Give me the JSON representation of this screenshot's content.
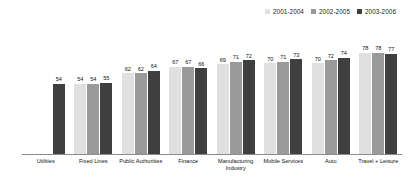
{
  "chart_data": {
    "type": "bar",
    "title": "",
    "subtitle": "",
    "xlabel": "",
    "ylabel": "",
    "ylim": [
      0,
      100
    ],
    "grid": false,
    "legend_position": "top-right",
    "categories": [
      "Utilities",
      "Fixed Lines",
      "Public Authorities",
      "Finance",
      "Manufacturing\nIndustry",
      "Mobile Services",
      "Auto",
      "Travel + Leisure"
    ],
    "series": [
      {
        "name": "2001-2004",
        "color": "#e0e0e0",
        "values": [
          null,
          54,
          62,
          67,
          69,
          70,
          70,
          78
        ]
      },
      {
        "name": "2002-2005",
        "color": "#9a9a9a",
        "values": [
          null,
          54,
          62,
          67,
          71,
          71,
          72,
          78
        ]
      },
      {
        "name": "2003-2006",
        "color": "#3f3f3f",
        "values": [
          54,
          55,
          64,
          66,
          72,
          73,
          74,
          77
        ]
      }
    ]
  },
  "colors": {
    "series_1": "#e0e0e0",
    "series_2": "#9a9a9a",
    "series_3": "#3f3f3f",
    "axis": "#8c8c8c",
    "text": "#111111",
    "background": "#ffffff"
  }
}
